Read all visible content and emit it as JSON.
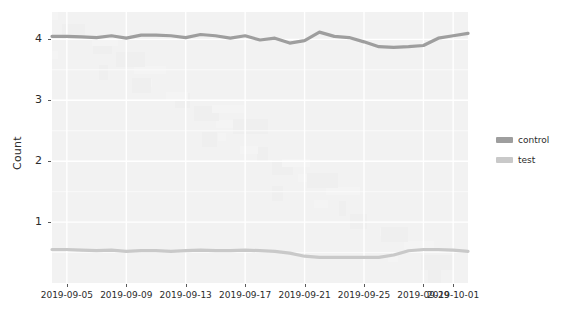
{
  "chart_data": {
    "type": "line",
    "title": "",
    "xlabel": "",
    "ylabel": "Count",
    "ylim": [
      0,
      4.45
    ],
    "grid": true,
    "legend_position": "right",
    "theme": "light-gray-panel",
    "y_ticks": [
      1,
      2,
      3,
      4
    ],
    "y_tick_labels": [
      "1",
      "2",
      "3",
      "4"
    ],
    "x_ticks": [
      "2019-09-05",
      "2019-09-09",
      "2019-09-13",
      "2019-09-17",
      "2019-09-21",
      "2019-09-25",
      "2019-09-29",
      "2019-10-01"
    ],
    "x_tick_labels": [
      "2019-09-05",
      "2019-09-09",
      "2019-09-13",
      "2019-09-17",
      "2019-09-21",
      "2019-09-25",
      "2019-09-29",
      "2019-10-01"
    ],
    "x_domain": [
      "2019-09-04",
      "2019-10-02"
    ],
    "dates": [
      "2019-09-04",
      "2019-09-05",
      "2019-09-06",
      "2019-09-07",
      "2019-09-08",
      "2019-09-09",
      "2019-09-10",
      "2019-09-11",
      "2019-09-12",
      "2019-09-13",
      "2019-09-14",
      "2019-09-15",
      "2019-09-16",
      "2019-09-17",
      "2019-09-18",
      "2019-09-19",
      "2019-09-20",
      "2019-09-21",
      "2019-09-22",
      "2019-09-23",
      "2019-09-24",
      "2019-09-25",
      "2019-09-26",
      "2019-09-27",
      "2019-09-28",
      "2019-09-29",
      "2019-09-30",
      "2019-10-01",
      "2019-10-02"
    ],
    "series": [
      {
        "name": "control",
        "color": "#9e9e9e",
        "values": [
          4.05,
          4.05,
          4.04,
          4.03,
          4.06,
          4.02,
          4.07,
          4.07,
          4.06,
          4.03,
          4.08,
          4.06,
          4.02,
          4.06,
          3.99,
          4.02,
          3.94,
          3.98,
          4.12,
          4.05,
          4.03,
          3.96,
          3.88,
          3.87,
          3.88,
          3.9,
          4.02,
          4.06,
          4.1
        ]
      },
      {
        "name": "test",
        "color": "#c9c9c9",
        "values": [
          0.55,
          0.55,
          0.54,
          0.53,
          0.54,
          0.52,
          0.53,
          0.53,
          0.52,
          0.53,
          0.54,
          0.53,
          0.53,
          0.54,
          0.53,
          0.52,
          0.49,
          0.44,
          0.42,
          0.42,
          0.42,
          0.42,
          0.42,
          0.46,
          0.53,
          0.55,
          0.55,
          0.54,
          0.52
        ]
      }
    ],
    "legend_entries": [
      {
        "label": "control",
        "color": "#9e9e9e"
      },
      {
        "label": "test",
        "color": "#c9c9c9"
      }
    ],
    "colors": {
      "panel_background": "#f2f2f2",
      "grid_major": "#ffffff",
      "grid_minor": "#fafafa",
      "plot_background": "#ffffff",
      "text": "#2b2b2b",
      "tick_mark": "#5a5a5a"
    }
  }
}
